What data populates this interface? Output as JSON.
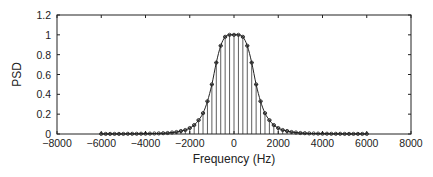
{
  "chart_data": {
    "type": "line",
    "subtype": "stem-with-curve",
    "title": "",
    "xlabel": "Frequency (Hz)",
    "ylabel": "PSD",
    "xlim": [
      -8000,
      8000
    ],
    "ylim": [
      0,
      1.2
    ],
    "xticks": [
      -8000,
      -6000,
      -4000,
      -2000,
      0,
      2000,
      4000,
      6000,
      8000
    ],
    "xtick_labels": [
      "−8000",
      "−6000",
      "−4000",
      "−2000",
      "0",
      "2000",
      "4000",
      "6000",
      "8000"
    ],
    "yticks": [
      0,
      0.2,
      0.4,
      0.6,
      0.8,
      1,
      1.2
    ],
    "ytick_labels": [
      "0",
      "0.2",
      "0.4",
      "0.6",
      "0.8",
      "1",
      "1.2"
    ],
    "grid": false,
    "legend": null,
    "series": [
      {
        "name": "PSD samples",
        "style": "stem with circle markers and smooth connecting curve",
        "color": "#222222",
        "x": [
          0,
          200,
          400,
          600,
          800,
          1000,
          1200,
          1400,
          1600,
          1800,
          2000,
          2200,
          2400,
          2600,
          2800,
          3000,
          3200,
          3400,
          3600,
          3800,
          4000,
          4200,
          4400,
          4600,
          4800,
          5000,
          5200,
          5400,
          5600,
          5800,
          6000
        ],
        "half_values": [
          1.0,
          1.0,
          0.98,
          0.89,
          0.72,
          0.5,
          0.33,
          0.21,
          0.14,
          0.09,
          0.06,
          0.04,
          0.03,
          0.02,
          0.015,
          0.01,
          0.008,
          0.006,
          0.005,
          0.004,
          0.003,
          0.003,
          0.002,
          0.002,
          0.002,
          0.001,
          0.001,
          0.001,
          0.001,
          0.001,
          0.001
        ],
        "symmetric": true,
        "note": "Values are symmetric about 0 Hz; negative frequencies mirror positive ones."
      }
    ]
  }
}
